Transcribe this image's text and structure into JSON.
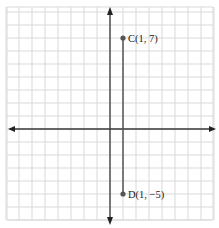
{
  "chart_data": {
    "type": "scatter",
    "title": "",
    "xlabel": "",
    "ylabel": "",
    "xlim": [
      -8,
      8
    ],
    "ylim": [
      -7,
      9
    ],
    "grid": true,
    "axes_arrows": true,
    "points": [
      {
        "name": "C",
        "x": 1,
        "y": 7,
        "label": "C(1, 7)"
      },
      {
        "name": "D",
        "x": 1,
        "y": -5,
        "label": "D(1, −5)"
      }
    ],
    "segments": [
      {
        "from": "C",
        "to": "D"
      }
    ]
  }
}
